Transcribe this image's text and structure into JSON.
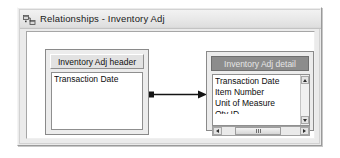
{
  "window": {
    "title": "Relationships - Inventory Adj",
    "icon": "relationships-icon"
  },
  "canvas": {
    "tables": [
      {
        "id": "inventory-adj-header",
        "title": "Inventory Adj header",
        "selected": false,
        "fields": [
          "Transaction Date"
        ],
        "scrollbars": {
          "vertical": false,
          "horizontal": false
        }
      },
      {
        "id": "inventory-adj-detail",
        "title": "Inventory Adj detail",
        "selected": true,
        "fields": [
          "Transaction Date",
          "Item Number",
          "Unit of Measure"
        ],
        "clipped_field": "Qty ID",
        "scrollbars": {
          "vertical": true,
          "horizontal": true
        }
      }
    ],
    "relationship": {
      "from": "inventory-adj-header",
      "to": "inventory-adj-detail",
      "marker_start": "square",
      "marker_end": "arrow"
    }
  },
  "colors": {
    "window_face": "#ebebeb",
    "canvas_bg": "#ffffff",
    "table_face": "#ececec",
    "header_inactive": "#e2e2e2",
    "header_active": "#8c8c8c",
    "header_active_text": "#e6e6e6",
    "connector": "#141414"
  },
  "icons": {
    "scroll_up": "triangle-up-icon",
    "scroll_down": "triangle-down-icon",
    "scroll_left": "triangle-left-icon",
    "scroll_right": "triangle-right-icon"
  }
}
